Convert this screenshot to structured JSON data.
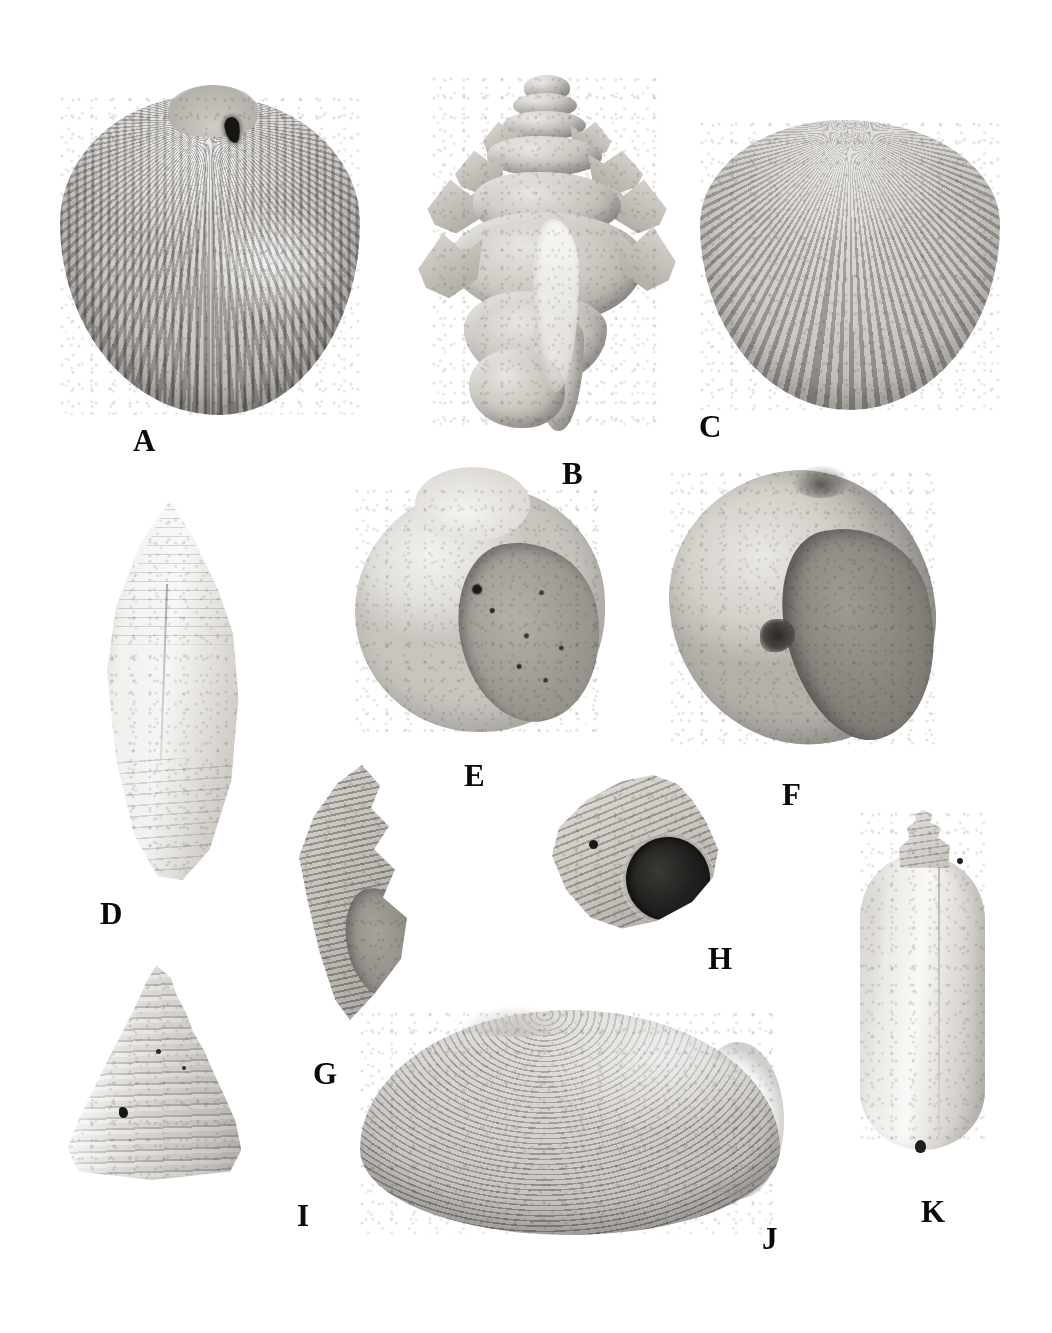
{
  "plate": {
    "title": "Mollusc shell specimen plate",
    "background_color": "#ffffff",
    "label_color": "#0a0a0a",
    "width": 1052,
    "height": 1333,
    "caption": ""
  },
  "specimens": [
    {
      "label": "A",
      "name": "ribbed-cockle-bivalve",
      "description": "Large radially ribbed bivalve (cockle), exterior view with boring hole near umbo",
      "shape": "bivalve-fan",
      "x": 60,
      "y": 95,
      "w": 300,
      "h": 320,
      "label_x": 133,
      "label_y": 425
    },
    {
      "label": "B",
      "name": "spiny-murex-gastropod",
      "description": "Spiny murex gastropod with frilled varices and high spire, apertural view",
      "shape": "murex",
      "x": 432,
      "y": 75,
      "w": 230,
      "h": 360,
      "label_x": 562,
      "label_y": 458
    },
    {
      "label": "C",
      "name": "round-ribbed-cockle-bivalve",
      "description": "Rounded radially ribbed bivalve (cockle), exterior view",
      "shape": "bivalve-round",
      "x": 700,
      "y": 120,
      "w": 300,
      "h": 290,
      "label_x": 699,
      "label_y": 411
    },
    {
      "label": "D",
      "name": "cone-shell-gastropod",
      "description": "Elongate cone shell (Conus) with stepped conical spire, dorsal view",
      "shape": "cone",
      "x": 80,
      "y": 500,
      "w": 180,
      "h": 380,
      "label_x": 100,
      "label_y": 898
    },
    {
      "label": "E",
      "name": "globose-moon-snail",
      "description": "Globose moon snail with broad speckled aperture, apertural view",
      "shape": "naticid",
      "x": 355,
      "y": 487,
      "w": 250,
      "h": 245,
      "label_x": 464,
      "label_y": 760
    },
    {
      "label": "F",
      "name": "large-moon-snail",
      "description": "Large moon snail with deep aperture and umbilical callus, apertural view",
      "shape": "naticid-large",
      "x": 670,
      "y": 470,
      "w": 265,
      "h": 275,
      "label_x": 782,
      "label_y": 779
    },
    {
      "label": "G",
      "name": "ribbed-spindle-gastropod",
      "description": "Ribbed fusiform gastropod with elongate aperture, apertural view",
      "shape": "fusiform",
      "x": 275,
      "y": 765,
      "w": 150,
      "h": 255,
      "label_x": 313,
      "label_y": 1058
    },
    {
      "label": "H",
      "name": "turban-snail",
      "description": "Turban / trochid snail with dark circular aperture, apertural view",
      "shape": "turbinid",
      "x": 545,
      "y": 775,
      "w": 175,
      "h": 155,
      "label_x": 708,
      "label_y": 943
    },
    {
      "label": "I",
      "name": "conical-top-shell",
      "description": "Conical top shell with stepped, beaded whorls, lateral view",
      "shape": "trochid-cone",
      "x": 60,
      "y": 965,
      "w": 185,
      "h": 215,
      "label_x": 297,
      "label_y": 1200
    },
    {
      "label": "J",
      "name": "smooth-venus-clam",
      "description": "Large ovate clam with fine concentric growth lines, exterior view",
      "shape": "bivalve-oval",
      "x": 360,
      "y": 1010,
      "w": 420,
      "h": 225,
      "label_x": 762,
      "label_y": 1223
    },
    {
      "label": "K",
      "name": "olive-shell-gastropod",
      "description": "Elongate cylindrical olive shell with low spire, dorsal view",
      "shape": "oliva",
      "x": 860,
      "y": 810,
      "w": 125,
      "h": 340,
      "label_x": 921,
      "label_y": 1196
    }
  ]
}
